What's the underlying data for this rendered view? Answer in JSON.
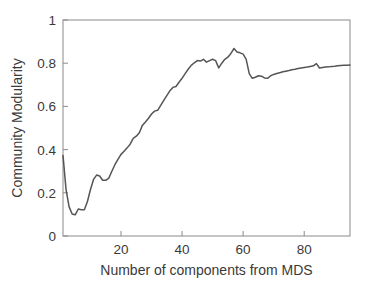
{
  "chart_data": {
    "type": "line",
    "title": "",
    "xlabel": "Number of components from MDS",
    "ylabel": "Community Modularity",
    "xlim": [
      1,
      95
    ],
    "ylim": [
      0,
      1
    ],
    "xticks": [
      20,
      40,
      60,
      80
    ],
    "xtick_labels": [
      "20",
      "40",
      "60",
      "80"
    ],
    "yticks": [
      0,
      0.2,
      0.4,
      0.6,
      0.8,
      1
    ],
    "ytick_labels": [
      "0",
      "0.2",
      "0.4",
      "0.6",
      "0.8",
      "1"
    ],
    "grid": false,
    "legend": "none",
    "line_color": "#555555",
    "axis_color": "#8a8a8a",
    "background": "#ffffff",
    "series": [
      {
        "name": "Community Modularity vs components",
        "x": [
          1,
          2,
          3,
          4,
          5,
          6,
          7,
          8,
          9,
          10,
          11,
          12,
          13,
          14,
          15,
          16,
          17,
          18,
          19,
          20,
          21,
          22,
          23,
          24,
          25,
          26,
          27,
          28,
          29,
          30,
          31,
          32,
          33,
          34,
          35,
          36,
          37,
          38,
          39,
          40,
          41,
          42,
          43,
          44,
          45,
          46,
          47,
          48,
          49,
          50,
          51,
          52,
          53,
          54,
          55,
          56,
          57,
          58,
          59,
          60,
          61,
          62,
          63,
          64,
          65,
          66,
          67,
          68,
          69,
          70,
          71,
          72,
          73,
          74,
          75,
          76,
          77,
          78,
          79,
          80,
          81,
          82,
          83,
          84,
          85,
          86,
          87,
          88,
          89,
          90,
          91,
          92,
          93,
          94,
          95
        ],
        "y": [
          0.373,
          0.215,
          0.135,
          0.102,
          0.098,
          0.125,
          0.122,
          0.122,
          0.16,
          0.215,
          0.262,
          0.282,
          0.278,
          0.258,
          0.258,
          0.268,
          0.3,
          0.33,
          0.355,
          0.378,
          0.392,
          0.408,
          0.425,
          0.452,
          0.462,
          0.478,
          0.512,
          0.528,
          0.545,
          0.565,
          0.578,
          0.582,
          0.605,
          0.628,
          0.65,
          0.672,
          0.688,
          0.692,
          0.712,
          0.73,
          0.752,
          0.772,
          0.79,
          0.802,
          0.812,
          0.81,
          0.818,
          0.805,
          0.812,
          0.818,
          0.812,
          0.778,
          0.8,
          0.818,
          0.828,
          0.845,
          0.868,
          0.852,
          0.848,
          0.842,
          0.818,
          0.752,
          0.73,
          0.735,
          0.742,
          0.74,
          0.732,
          0.73,
          0.742,
          0.748,
          0.752,
          0.756,
          0.76,
          0.763,
          0.766,
          0.77,
          0.772,
          0.775,
          0.778,
          0.78,
          0.782,
          0.785,
          0.788,
          0.798,
          0.778,
          0.78,
          0.782,
          0.783,
          0.785,
          0.786,
          0.788,
          0.789,
          0.79,
          0.791,
          0.792
        ]
      }
    ]
  }
}
